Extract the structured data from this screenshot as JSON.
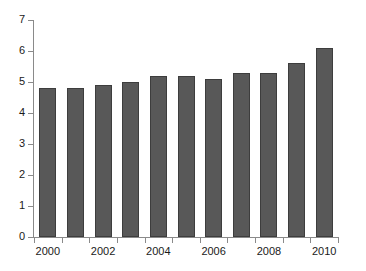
{
  "chart_data": {
    "type": "bar",
    "title": "",
    "subtitle": "",
    "xlabel": "",
    "ylabel": "",
    "categories": [
      "2000",
      "2001",
      "2002",
      "2003",
      "2004",
      "2005",
      "2006",
      "2007",
      "2008",
      "2009",
      "2010"
    ],
    "values": [
      4.8,
      4.8,
      4.9,
      5.0,
      5.2,
      5.2,
      5.1,
      5.3,
      5.3,
      5.6,
      6.1
    ],
    "series": [
      {
        "name": "",
        "values": [
          4.8,
          4.8,
          4.9,
          5.0,
          5.2,
          5.2,
          5.1,
          5.3,
          5.3,
          5.6,
          6.1
        ]
      }
    ],
    "ylim": [
      0,
      7
    ],
    "yticks": [
      "0",
      "1",
      "2",
      "3",
      "4",
      "5",
      "6",
      "7"
    ],
    "ytick_values": [
      0,
      1,
      2,
      3,
      4,
      5,
      6,
      7
    ],
    "xtick_labels": [
      "2000",
      "2002",
      "2004",
      "2006",
      "2008",
      "2010"
    ],
    "xtick_label_indices": [
      0,
      2,
      4,
      6,
      8,
      10
    ],
    "grid": false,
    "legend": false,
    "legend_position": "none",
    "bar_color": "#585858",
    "bar_edge_color": "#3d3d3d",
    "axis_color": "#8a8a8a",
    "background_color": "#ffffff",
    "text_color": "#1a1a1a"
  }
}
